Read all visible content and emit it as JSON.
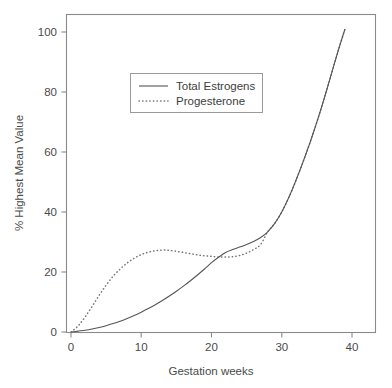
{
  "chart_data": {
    "type": "line",
    "title": "",
    "xlabel": "Gestation weeks",
    "ylabel": "% Highest Mean Value",
    "xlim": [
      0,
      44
    ],
    "ylim": [
      0,
      105
    ],
    "xticks": [
      0,
      10,
      20,
      30,
      40
    ],
    "yticks": [
      0,
      20,
      40,
      60,
      80,
      100
    ],
    "grid": false,
    "frame": "box",
    "legend_position": "upper-center-left",
    "x": [
      0,
      1,
      2,
      3,
      4,
      5,
      6,
      7,
      8,
      9,
      10,
      11,
      12,
      13,
      14,
      15,
      16,
      17,
      18,
      19,
      20,
      21,
      22,
      23,
      24,
      25,
      26,
      27,
      28,
      29,
      30,
      31,
      32,
      33,
      34,
      35,
      36,
      37,
      38,
      39
    ],
    "series": [
      {
        "name": "Total Estrogens",
        "style": "solid",
        "color": "#555555",
        "values": [
          0,
          0.3,
          0.6,
          1.0,
          1.5,
          2.1,
          2.8,
          3.6,
          4.5,
          5.5,
          6.6,
          7.8,
          9.1,
          10.5,
          12.0,
          13.6,
          15.3,
          17.1,
          19.0,
          21.0,
          23.1,
          24.9,
          26.5,
          27.5,
          28.3,
          29.2,
          30.2,
          31.5,
          33.4,
          36.2,
          40.0,
          44.8,
          50.4,
          56.5,
          63.0,
          70.0,
          77.5,
          85.5,
          93.5,
          101.0
        ]
      },
      {
        "name": "Progesterone",
        "style": "dotted",
        "color": "#777777",
        "values": [
          0,
          2.0,
          5.0,
          8.5,
          12.2,
          15.6,
          18.6,
          21.0,
          23.0,
          24.6,
          25.8,
          26.6,
          27.1,
          27.3,
          27.2,
          26.9,
          26.5,
          26.1,
          25.7,
          25.4,
          25.2,
          25.0,
          25.0,
          25.1,
          25.5,
          26.3,
          27.5,
          29.2,
          33.4,
          36.2,
          40.0,
          44.8,
          50.4,
          56.5,
          63.0,
          70.0,
          77.5,
          85.5,
          93.5,
          101.0
        ]
      }
    ],
    "legend": [
      {
        "label": "Total Estrogens",
        "style": "solid"
      },
      {
        "label": "Progesterone",
        "style": "dotted"
      }
    ],
    "annotations": []
  },
  "axes": {
    "x_tick_labels": [
      "0",
      "10",
      "20",
      "30",
      "40"
    ],
    "y_tick_labels": [
      "0",
      "20",
      "40",
      "60",
      "80",
      "100"
    ],
    "x_title": "Gestation weeks",
    "y_title": "% Highest Mean Value"
  },
  "colors": {
    "background": "#ffffff",
    "frame": "#8a8a8a",
    "text": "#4a4a4a",
    "estrogens": "#555555",
    "progesterone": "#777777"
  }
}
